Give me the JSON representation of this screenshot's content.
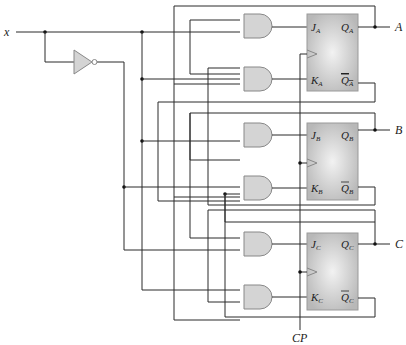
{
  "diagram": {
    "input_label": "x",
    "clock_label": "CP",
    "outputs": [
      "A",
      "B",
      "C"
    ],
    "flip_flops": [
      {
        "name": "A",
        "j": "J",
        "j_sub": "A",
        "k": "K",
        "k_sub": "A",
        "q": "Q",
        "q_sub": "A",
        "qn": "Q",
        "qn_sub": "A"
      },
      {
        "name": "B",
        "j": "J",
        "j_sub": "B",
        "k": "K",
        "k_sub": "B",
        "q": "Q",
        "q_sub": "B",
        "qn": "Q",
        "qn_sub": "B"
      },
      {
        "name": "C",
        "j": "J",
        "j_sub": "C",
        "k": "K",
        "k_sub": "C",
        "q": "Q",
        "q_sub": "C",
        "qn": "Q",
        "qn_sub": "C"
      }
    ],
    "gates": [
      "AND-JA",
      "AND-KA",
      "AND-JB",
      "AND-KB",
      "AND-JC",
      "AND-KC",
      "NOT-x"
    ],
    "colors": {
      "gate_fill": "#d4d4d4",
      "ff_fill": "#c8c8c8",
      "wire": "#2a2a2a"
    }
  }
}
